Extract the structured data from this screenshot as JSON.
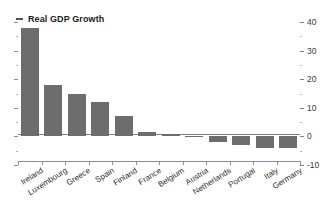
{
  "legend": {
    "marker": "dash-marker",
    "label": "Real GDP Growth"
  },
  "chart_data": {
    "type": "bar",
    "title": "Real GDP Growth",
    "xlabel": "",
    "ylabel": "",
    "ylim": [
      -10,
      40
    ],
    "yticks": [
      -10,
      0,
      10,
      20,
      30,
      40
    ],
    "ytick_labels": [
      "-10",
      "0",
      "10",
      "20",
      "30",
      "40"
    ],
    "minor_yticks": [
      -5,
      5,
      15,
      25,
      35
    ],
    "grid": false,
    "legend_position": "top-left",
    "axis_position": "right",
    "bar_color": "#6d6d6d",
    "categories": [
      "Ireland",
      "Luxembourg",
      "Greece",
      "Spain",
      "Finland",
      "France",
      "Belgium",
      "Austria",
      "Netherlands",
      "Portugal",
      "Italy",
      "Germany"
    ],
    "values": [
      37.8,
      18.0,
      15.0,
      12.2,
      7.0,
      1.6,
      0.8,
      0.3,
      -2.0,
      -3.0,
      -4.0,
      -4.0
    ],
    "series": [
      {
        "name": "Real GDP Growth",
        "values": [
          37.8,
          18.0,
          15.0,
          12.2,
          7.0,
          1.6,
          0.8,
          0.3,
          -2.0,
          -3.0,
          -4.0,
          -4.0
        ]
      }
    ]
  }
}
